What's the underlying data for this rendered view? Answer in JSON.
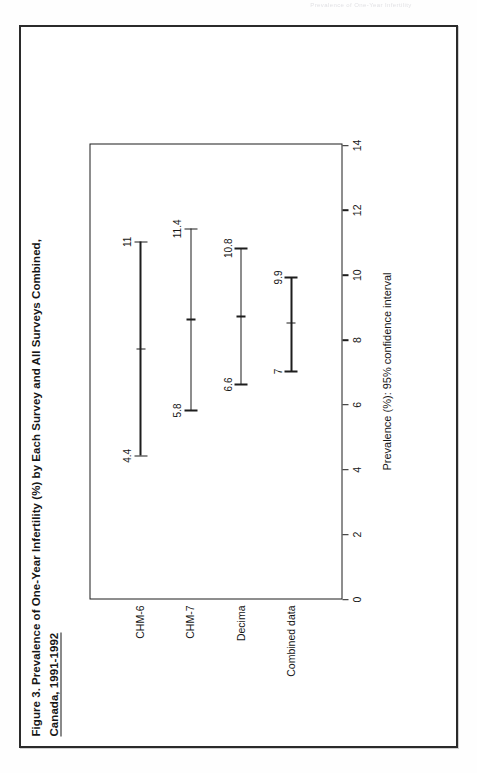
{
  "page": {
    "header_faint_text": "Prevalence of One-Year Infertility"
  },
  "figure": {
    "title_line1": "Figure 3.   Prevalence of One-Year Infertility (%) by Each Survey and All Surveys Combined,",
    "title_line2": "Canada, 1991-1992"
  },
  "chart_data": {
    "type": "errorbar",
    "orientation": "horizontal",
    "title": "Figure 3. Prevalence of One-Year Infertility (%) by Each Survey and All Surveys Combined, Canada, 1991-1992",
    "xlabel": "Prevalence (%): 95% confidence interval",
    "ylabel": "",
    "xlim": [
      0,
      14
    ],
    "xticks": [
      0,
      2,
      4,
      6,
      8,
      10,
      12,
      14
    ],
    "xticklabels": [
      "0",
      "2",
      "4",
      "6",
      "8",
      "10",
      "12",
      "14"
    ],
    "grid": false,
    "legend": "none",
    "categories": [
      "CHM-6",
      "CHM-7",
      "Decima",
      "Combined data"
    ],
    "series": [
      {
        "name": "95% confidence interval",
        "points": [
          {
            "category": "CHM-6",
            "low": 4.4,
            "high": 11.0,
            "point": 7.7,
            "low_label": "4.4",
            "high_label": "11"
          },
          {
            "category": "CHM-7",
            "low": 5.8,
            "high": 11.4,
            "point": 8.6,
            "low_label": "5.8",
            "high_label": "11.4"
          },
          {
            "category": "Decima",
            "low": 6.6,
            "high": 10.8,
            "point": 8.7,
            "low_label": "6.6",
            "high_label": "10.8"
          },
          {
            "category": "Combined data",
            "low": 7.0,
            "high": 9.9,
            "point": 8.5,
            "low_label": "7",
            "high_label": "9.9"
          }
        ]
      }
    ]
  },
  "colors": {
    "ink": "#1d1d1d",
    "frame": "#2b2b2b",
    "paper": "#ffffff"
  }
}
